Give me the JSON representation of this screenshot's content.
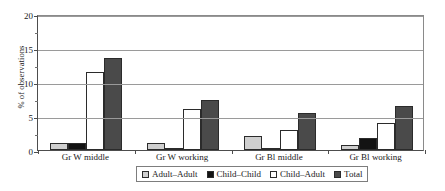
{
  "chart_data": {
    "type": "bar",
    "title": "",
    "xlabel": "",
    "ylabel": "% of observations",
    "ylim": [
      0,
      20
    ],
    "yticks": [
      0,
      5,
      10,
      15,
      20
    ],
    "ytick_labels": [
      "0",
      "5",
      "10",
      "15",
      "20"
    ],
    "grid": true,
    "legend_position": "bottom",
    "categories": [
      "Gr W middle",
      "Gr W working",
      "Gr Bl middle",
      "Gr Bl working"
    ],
    "series": [
      {
        "name": "Adult–Adult",
        "color": "#cfcfcf",
        "values": [
          1.0,
          1.0,
          2.0,
          0.8
        ]
      },
      {
        "name": "Child–Child",
        "color": "#131313",
        "values": [
          1.0,
          0.3,
          0.3,
          1.8
        ]
      },
      {
        "name": "Child–Adult",
        "color": "#ffffff",
        "values": [
          11.5,
          6.0,
          3.0,
          4.0
        ]
      },
      {
        "name": "Total",
        "color": "#4a4a4a",
        "values": [
          13.5,
          7.3,
          5.5,
          6.4
        ]
      }
    ]
  },
  "axis": {
    "y_title": "% of observations"
  }
}
